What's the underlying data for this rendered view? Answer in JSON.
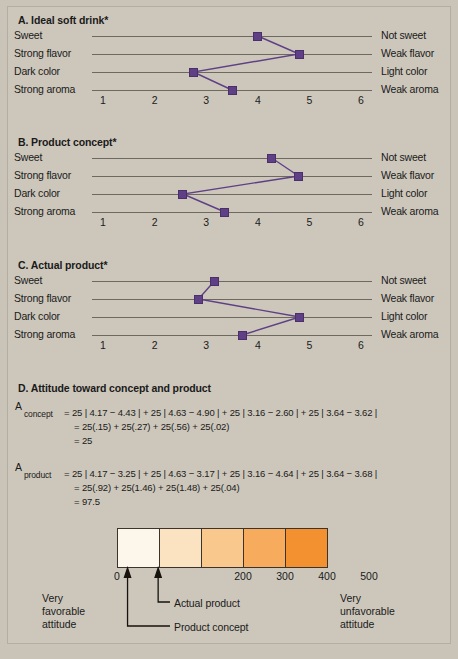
{
  "panels": [
    {
      "title": "A. Ideal soft drink*",
      "left_labels": [
        "Sweet",
        "Strong flavor",
        "Dark color",
        "Strong aroma"
      ],
      "right_labels": [
        "Not sweet",
        "Weak flavor",
        "Light color",
        "Weak aroma"
      ],
      "ticks": [
        "1",
        "2",
        "3",
        "4",
        "5",
        "6"
      ],
      "values": [
        4.0,
        4.8,
        2.75,
        3.5
      ]
    },
    {
      "title": "B. Product concept*",
      "left_labels": [
        "Sweet",
        "Strong flavor",
        "Dark color",
        "Strong aroma"
      ],
      "right_labels": [
        "Not sweet",
        "Weak flavor",
        "Light color",
        "Weak aroma"
      ],
      "ticks": [
        "1",
        "2",
        "3",
        "4",
        "5",
        "6"
      ],
      "values": [
        4.27,
        4.79,
        2.55,
        3.36
      ]
    },
    {
      "title": "C. Actual product*",
      "left_labels": [
        "Sweet",
        "Strong flavor",
        "Dark color",
        "Strong aroma"
      ],
      "right_labels": [
        "Not sweet",
        "Weak flavor",
        "Light color",
        "Weak aroma"
      ],
      "ticks": [
        "1",
        "2",
        "3",
        "4",
        "5",
        "6"
      ],
      "values": [
        3.16,
        2.85,
        4.81,
        3.7
      ]
    }
  ],
  "section_d": {
    "title": "D. Attitude toward concept and product",
    "concept": {
      "symbol": "A",
      "subscript": "concept",
      "line1": "= 25 | 4.17 − 4.43 | + 25 | 4.63 − 4.90 | + 25 | 3.16 − 2.60 | + 25 | 3.64 − 3.62 |",
      "line2": "= 25(.15) + 25(.27) + 25(.56) + 25(.02)",
      "line3": "= 25"
    },
    "product": {
      "symbol": "A",
      "subscript": "product",
      "line1": "= 25 | 4.17 − 3.25 | + 25 | 4.63 − 3.17 | + 25 | 3.16 − 4.64 | + 25 | 3.64 − 3.68 |",
      "line2": "= 25(.92) + 25(1.46) + 25(1.48) + 25(.04)",
      "line3": "= 97.5"
    }
  },
  "scale": {
    "segment_colors": [
      "#fdf6ea",
      "#fbe2c0",
      "#f9c88d",
      "#f7ab5c",
      "#f3902f"
    ],
    "tick_labels": [
      "0",
      "200",
      "300",
      "400",
      "500"
    ],
    "tick_positions": [
      117,
      243,
      285,
      327,
      369
    ],
    "axis_min": 0,
    "axis_max": 500,
    "markers": [
      {
        "label": "Actual product",
        "value": 97.5
      },
      {
        "label": "Product concept",
        "value": 25
      }
    ],
    "left_caption": [
      "Very",
      "favorable",
      "attitude"
    ],
    "right_caption": [
      "Very",
      "unfavorable",
      "attitude"
    ]
  },
  "colors": {
    "background": "#cdc7bb",
    "marker": "#5f3f85",
    "line": "#6e6960",
    "accent_orange": "#f3902f"
  }
}
